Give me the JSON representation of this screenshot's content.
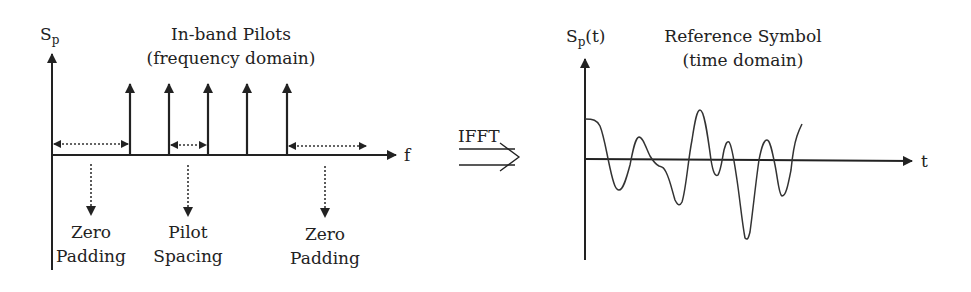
{
  "left_panel": {
    "y_axis_label": "S",
    "y_axis_subscript": "p",
    "x_axis_label": "f",
    "title_line1": "In-band Pilots",
    "title_line2": "(frequency domain)",
    "pilot_positions_x": [
      130,
      169,
      208,
      247,
      287
    ],
    "annotations": [
      {
        "id": "zero-padding-left",
        "line1": "Zero",
        "line2": "Padding"
      },
      {
        "id": "pilot-spacing",
        "line1": "Pilot",
        "line2": "Spacing"
      },
      {
        "id": "zero-padding-right",
        "line1": "Zero",
        "line2": "Padding"
      }
    ]
  },
  "transform": {
    "label": "IFFT"
  },
  "right_panel": {
    "y_axis_label": "S",
    "y_axis_subscript": "p",
    "y_axis_suffix": "(t)",
    "x_axis_label": "t",
    "title_line1": "Reference Symbol",
    "title_line2": "(time domain)"
  }
}
